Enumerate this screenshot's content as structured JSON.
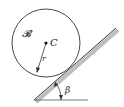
{
  "diagram": {
    "body_label": "𝓑",
    "center_label": "C",
    "radius_label": "r",
    "angle_label": "β"
  }
}
